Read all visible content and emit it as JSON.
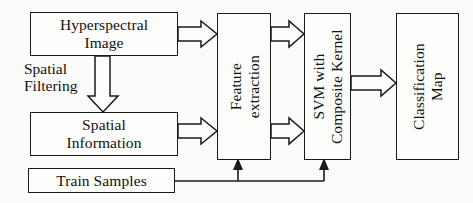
{
  "diagram": {
    "type": "flowchart",
    "orientation": "left-to-right",
    "colors": {
      "background": "#fbfbfa",
      "box_fill": "#fdfdfc",
      "stroke": "#1a1a1a",
      "text": "#111111"
    },
    "nodes": {
      "hyperspectral_image": {
        "label": "Hyperspectral\nImage",
        "shape": "rectangle",
        "text_orientation": "horizontal"
      },
      "spatial_information": {
        "label": "Spatial\nInformation",
        "shape": "rectangle",
        "text_orientation": "horizontal"
      },
      "train_samples": {
        "label": "Train Samples",
        "shape": "rectangle",
        "text_orientation": "horizontal"
      },
      "feature_extraction": {
        "label": "Feature\nextraction",
        "shape": "rectangle",
        "text_orientation": "vertical-rotated-90ccw"
      },
      "svm_composite_kernel": {
        "label": "SVM with\nComposite Kernel",
        "shape": "rectangle",
        "text_orientation": "vertical-rotated-90ccw"
      },
      "classification_map": {
        "label": "Classification\nMap",
        "shape": "rectangle",
        "text_orientation": "vertical-rotated-90ccw"
      }
    },
    "edge_labels": {
      "spatial_filtering": "Spatial\nFiltering"
    },
    "edges": [
      {
        "id": "hyperspectral-to-feature",
        "from": "hyperspectral_image",
        "to": "feature_extraction",
        "style": "hollow-block-arrow",
        "direction": "right"
      },
      {
        "id": "hyperspectral-to-spatial",
        "from": "hyperspectral_image",
        "to": "spatial_information",
        "style": "hollow-block-arrow",
        "direction": "down",
        "label": "spatial_filtering"
      },
      {
        "id": "spatial-to-feature",
        "from": "spatial_information",
        "to": "feature_extraction",
        "style": "hollow-block-arrow",
        "direction": "right"
      },
      {
        "id": "feature-to-svm-top",
        "from": "feature_extraction",
        "to": "svm_composite_kernel",
        "style": "hollow-block-arrow",
        "direction": "right"
      },
      {
        "id": "feature-to-svm-bottom",
        "from": "feature_extraction",
        "to": "svm_composite_kernel",
        "style": "hollow-block-arrow",
        "direction": "right"
      },
      {
        "id": "svm-to-classification",
        "from": "svm_composite_kernel",
        "to": "classification_map",
        "style": "hollow-block-arrow",
        "direction": "right"
      },
      {
        "id": "train-to-feature",
        "from": "train_samples",
        "to": "feature_extraction",
        "style": "thin-line-solid-arrow",
        "direction": "up"
      },
      {
        "id": "train-to-svm",
        "from": "train_samples",
        "to": "svm_composite_kernel",
        "style": "thin-line-solid-arrow",
        "direction": "up"
      }
    ]
  }
}
